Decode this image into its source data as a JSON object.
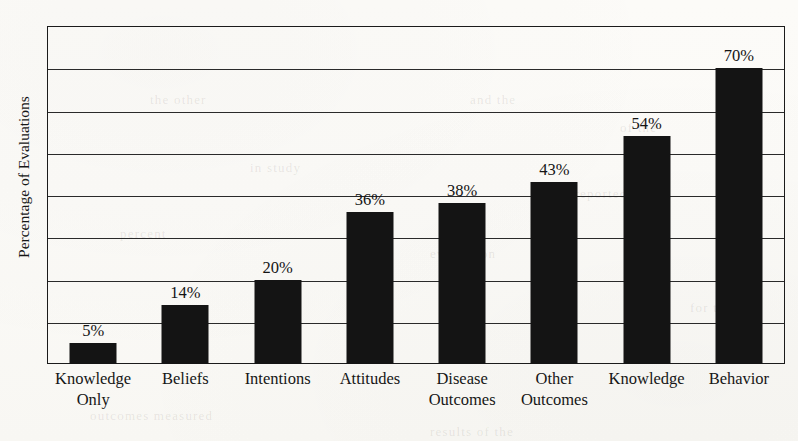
{
  "chart_data": {
    "type": "bar",
    "title": "",
    "xlabel": "",
    "ylabel": "Percentage of Evaluations",
    "ylim": [
      0,
      80
    ],
    "grid": true,
    "gridline_interval": 10,
    "legend": "none",
    "value_suffix": "%",
    "categories": [
      "Knowledge Only",
      "Beliefs",
      "Intentions",
      "Attitudes",
      "Disease Outcomes",
      "Other Outcomes",
      "Knowledge",
      "Behavior"
    ],
    "category_lines": [
      [
        "Knowledge",
        "Only"
      ],
      [
        "Beliefs"
      ],
      [
        "Intentions"
      ],
      [
        "Attitudes"
      ],
      [
        "Disease",
        "Outcomes"
      ],
      [
        "Other",
        "Outcomes"
      ],
      [
        "Knowledge"
      ],
      [
        "Behavior"
      ]
    ],
    "values": [
      5,
      14,
      20,
      36,
      38,
      43,
      54,
      70
    ],
    "value_labels": [
      "5%",
      "14%",
      "20%",
      "36%",
      "38%",
      "43%",
      "54%",
      "70%"
    ],
    "bar_color": "#141414"
  },
  "ghost_text": {
    "a": "the other",
    "b": "and the",
    "c": "of the",
    "d": "in study",
    "e": "were reported",
    "f": "percent",
    "g": "evaluation",
    "h": "outcomes measured",
    "i": "results of the",
    "j": "for the"
  }
}
